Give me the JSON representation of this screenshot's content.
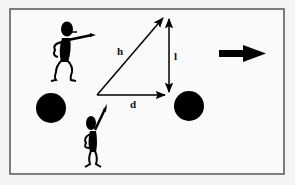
{
  "diagram": {
    "background": "#f4f4f4",
    "frame": {
      "x": 10,
      "y": 9,
      "width": 274,
      "height": 165,
      "stroke": "#555555",
      "fill": "#fafafa"
    },
    "labels": {
      "hypotenuse": "h",
      "height": "l",
      "distance": "d"
    },
    "triangle": {
      "origin": [
        97,
        95
      ],
      "top": [
        165,
        17
      ],
      "base_end": [
        165,
        95
      ],
      "vertical_x": 169
    },
    "balls": [
      {
        "name": "left-ball",
        "cx": 51,
        "cy": 108,
        "r": 15,
        "color": "#000000"
      },
      {
        "name": "right-ball",
        "cx": 189,
        "cy": 106,
        "r": 15,
        "color": "#000000"
      }
    ],
    "direction_arrow": {
      "x1": 219,
      "x2": 265,
      "y": 54,
      "color": "#000000"
    },
    "figures": [
      {
        "name": "pointing-figure-top",
        "pose": "pointing-right"
      },
      {
        "name": "pointing-figure-bottom",
        "pose": "pointing-up"
      }
    ]
  }
}
